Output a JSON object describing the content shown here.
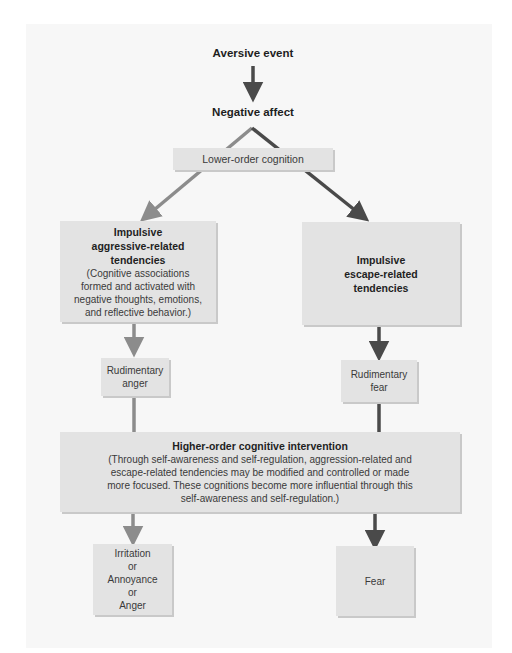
{
  "diagram": {
    "nodes": {
      "aversive_event": "Aversive event",
      "negative_affect": "Negative affect",
      "lower_order": "Lower-order cognition",
      "aggressive": {
        "title_lines": [
          "Impulsive",
          "aggressive-related",
          "tendencies"
        ],
        "body_lines": [
          "(Cognitive associations",
          "formed and activated with",
          "negative thoughts, emotions,",
          "and reflective behavior.)"
        ]
      },
      "escape": {
        "title_lines": [
          "Impulsive",
          "escape-related",
          "tendencies"
        ]
      },
      "rudimentary_anger": [
        "Rudimentary",
        "anger"
      ],
      "rudimentary_fear": [
        "Rudimentary",
        "fear"
      ],
      "higher_order": {
        "title": "Higher-order cognitive intervention",
        "body_lines": [
          "(Through self-awareness and self-regulation, aggression-related and",
          "escape-related tendencies may be modified and controlled or made",
          "more focused. These cognitions become more influential through this",
          "self-awareness and self-regulation.)"
        ]
      },
      "anger_outcome": [
        "Irritation",
        "or",
        "Annoyance",
        "or",
        "Anger"
      ],
      "fear_outcome": "Fear"
    },
    "colors": {
      "panel": "#f7f7f7",
      "box": "#e3e3e3",
      "arrow_dark": "#4a4a4a",
      "arrow_light": "#8c8c8c"
    },
    "edges": [
      {
        "from": "Aversive event",
        "to": "Negative affect"
      },
      {
        "from": "Negative affect",
        "to": "Impulsive aggressive-related tendencies",
        "via": "Lower-order cognition"
      },
      {
        "from": "Negative affect",
        "to": "Impulsive escape-related tendencies",
        "via": "Lower-order cognition"
      },
      {
        "from": "Impulsive aggressive-related tendencies",
        "to": "Rudimentary anger"
      },
      {
        "from": "Impulsive escape-related tendencies",
        "to": "Rudimentary fear"
      },
      {
        "from": "Rudimentary anger",
        "to": "Higher-order cognitive intervention"
      },
      {
        "from": "Rudimentary fear",
        "to": "Higher-order cognitive intervention"
      },
      {
        "from": "Higher-order cognitive intervention",
        "to": "Irritation or Annoyance or Anger"
      },
      {
        "from": "Higher-order cognitive intervention",
        "to": "Fear"
      }
    ]
  }
}
